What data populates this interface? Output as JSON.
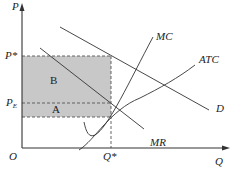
{
  "diagram": {
    "type": "monopoly-profit-diagram",
    "axes": {
      "y_label": "P",
      "x_label": "Q",
      "origin_label": "O"
    },
    "price_labels": {
      "p_star": "P*",
      "p_e": "P",
      "p_e_subscript": "E"
    },
    "quantity_labels": {
      "q_star": "Q*"
    },
    "regions": {
      "upper": "B",
      "lower": "A",
      "shade_color": "#c8c8c8"
    },
    "curves": {
      "mc": "MC",
      "atc": "ATC",
      "demand": "D",
      "mr": "MR"
    },
    "colors": {
      "line": "#333333",
      "dashed": "#555555"
    }
  }
}
